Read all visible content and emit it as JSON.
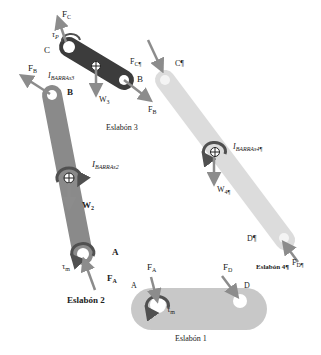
{
  "diagram": {
    "type": "free-body diagram of four-bar linkage",
    "colors": {
      "link1": "#c8c8c8",
      "link2": "#8a8a8a",
      "link3": "#3c3c3c",
      "link4": "#dcdcdc",
      "arrow": "#8c8c8c",
      "torque": "#505050",
      "text": "#222222"
    },
    "links": [
      {
        "id": "link1",
        "name": "Eslabón 1",
        "joints": [
          "A",
          "D"
        ]
      },
      {
        "id": "link2",
        "name": "Eslabón 2",
        "joints": [
          "A",
          "B"
        ]
      },
      {
        "id": "link3",
        "name": "Eslabón 3",
        "joints": [
          "C",
          "B"
        ]
      },
      {
        "id": "link4",
        "name": "Eslabón 4¶",
        "joints": [
          "C¶",
          "D¶"
        ]
      }
    ]
  },
  "link3": {
    "title": "Eslabón 3",
    "joint_c": "C",
    "joint_b": "B",
    "force_c": "F",
    "force_c_sub": "C",
    "force_b": "F",
    "force_b_sub": "B",
    "weight": "W",
    "weight_sub": "3",
    "torque": "τ",
    "torque_sub": "P",
    "inertia": "I",
    "inertia_sub": "BARRAs3",
    "force_c4": "F",
    "force_c4_sub": "C¶"
  },
  "link2": {
    "title": "Eslabón 2",
    "joint_b": "B",
    "joint_a": "A",
    "force_b": "F",
    "force_b_sub": "B",
    "force_a": "F",
    "force_a_sub": "A",
    "weight": "W",
    "weight_sub": "2",
    "torque": "τ",
    "torque_sub": "m",
    "inertia": "I",
    "inertia_sub": "BARRAs2"
  },
  "link4": {
    "title": "Eslabón 4¶",
    "joint_c": "C¶",
    "joint_d": "D¶",
    "force_d": "F",
    "force_d_sub": "D¶",
    "weight": "W",
    "weight_sub": "4¶",
    "inertia": "I",
    "inertia_sub": "BARRAs4¶"
  },
  "link1": {
    "title": "Eslabón 1",
    "joint_a": "A",
    "joint_d": "D",
    "force_a": "F",
    "force_a_sub": "A",
    "force_d": "F",
    "force_d_sub": "D",
    "torque": "τ",
    "torque_sub": "m"
  }
}
